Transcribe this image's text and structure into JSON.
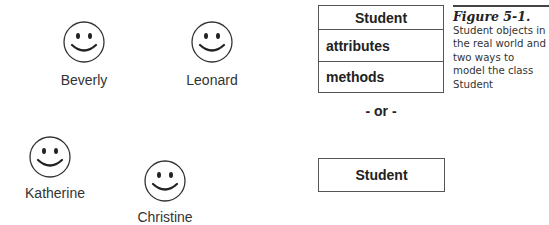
{
  "figure": {
    "number": "Figure 5-1.",
    "caption": "Student objects in the real world and two ways to model the class Student"
  },
  "objects": [
    {
      "name": "Beverly",
      "icon": "smiley-face-icon"
    },
    {
      "name": "Leonard",
      "icon": "smiley-face-icon"
    },
    {
      "name": "Katherine",
      "icon": "smiley-face-icon"
    },
    {
      "name": "Christine",
      "icon": "smiley-face-icon"
    }
  ],
  "uml_full": {
    "class_name": "Student",
    "attributes_label": "attributes",
    "methods_label": "methods"
  },
  "separator": "- or -",
  "uml_simple": {
    "class_name": "Student"
  }
}
